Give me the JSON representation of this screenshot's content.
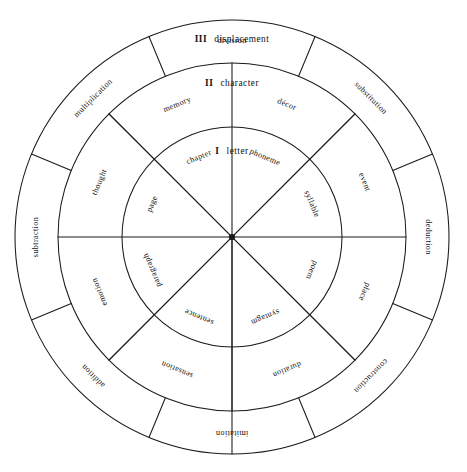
{
  "diagram": {
    "type": "concentric-sector-wheel",
    "title": "",
    "geometry": {
      "center_x": 232,
      "center_y": 237,
      "radius_inner": 110,
      "radius_middle": 174,
      "radius_outer": 217,
      "sectors_inner": 8,
      "sectors_middle": 8,
      "sectors_outer": 8,
      "inner_sector_span_deg": 45,
      "outer_sector_span_deg": 45,
      "outer_ring_offset_deg": 22.5,
      "stroke_color": "#1a1a1a",
      "background_color": "#ffffff"
    },
    "levels": [
      {
        "numeral": "I",
        "name": "letter",
        "ring": "inner"
      },
      {
        "numeral": "II",
        "name": "character",
        "ring": "middle"
      },
      {
        "numeral": "III",
        "name": "displacement",
        "ring": "outer"
      }
    ],
    "rings": [
      {
        "ring": "inner",
        "level_numeral": "I",
        "level_name": "letter",
        "labels": [
          {
            "text": "phoneme",
            "angle_deg": 22.5,
            "radius": 86
          },
          {
            "text": "syllable",
            "angle_deg": 67.5,
            "radius": 86
          },
          {
            "text": "poem",
            "angle_deg": 112.5,
            "radius": 86
          },
          {
            "text": "syntagm",
            "angle_deg": 157.5,
            "radius": 86
          },
          {
            "text": "sentence",
            "angle_deg": 202.5,
            "radius": 86
          },
          {
            "text": "paragraph",
            "angle_deg": 247.5,
            "radius": 86
          },
          {
            "text": "page",
            "angle_deg": 292.5,
            "radius": 86
          },
          {
            "text": "chapter",
            "angle_deg": 337.5,
            "radius": 86
          }
        ]
      },
      {
        "ring": "middle",
        "level_numeral": "II",
        "level_name": "character",
        "labels": [
          {
            "text": "décor",
            "angle_deg": 22.5,
            "radius": 143
          },
          {
            "text": "event",
            "angle_deg": 67.5,
            "radius": 143
          },
          {
            "text": "place",
            "angle_deg": 112.5,
            "radius": 143
          },
          {
            "text": "duration",
            "angle_deg": 157.5,
            "radius": 143
          },
          {
            "text": "sensation",
            "angle_deg": 202.5,
            "radius": 143
          },
          {
            "text": "emotion",
            "angle_deg": 247.5,
            "radius": 143
          },
          {
            "text": "thought",
            "angle_deg": 292.5,
            "radius": 143
          },
          {
            "text": "memory",
            "angle_deg": 337.5,
            "radius": 143
          }
        ]
      },
      {
        "ring": "outer",
        "level_numeral": "III",
        "level_name": "displacement",
        "labels": [
          {
            "text": "substitution",
            "angle_deg": 45,
            "radius": 196
          },
          {
            "text": "deduction",
            "angle_deg": 90,
            "radius": 196
          },
          {
            "text": "construction",
            "angle_deg": 135,
            "radius": 196
          },
          {
            "text": "imitation",
            "angle_deg": 180,
            "radius": 196
          },
          {
            "text": "addition",
            "angle_deg": 225,
            "radius": 196
          },
          {
            "text": "subtraction",
            "angle_deg": 270,
            "radius": 196
          },
          {
            "text": "multiplication",
            "angle_deg": 315,
            "radius": 196
          },
          {
            "text": "division",
            "angle_deg": 360,
            "radius": 196
          }
        ]
      }
    ],
    "level_headers": [
      {
        "numeral": "I",
        "name": "letter",
        "x": 232,
        "y": 152
      },
      {
        "numeral": "II",
        "name": "character",
        "x": 232,
        "y": 84
      },
      {
        "numeral": "III",
        "name": "displacement",
        "x": 232,
        "y": 40
      }
    ]
  }
}
